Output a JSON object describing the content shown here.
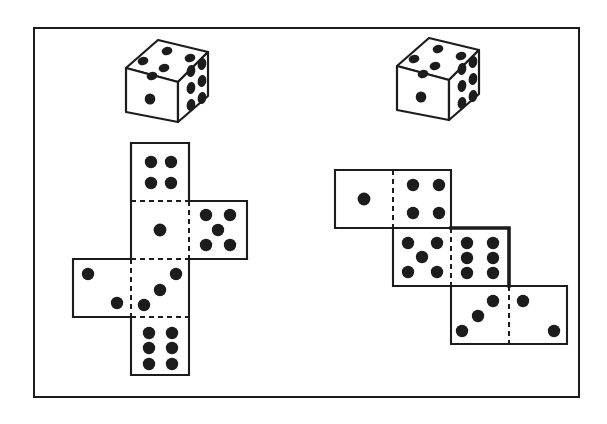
{
  "figure": {
    "background_color": "#ffffff",
    "ink_color": "#1c1c1c",
    "frame": {
      "x": 33,
      "y": 27,
      "width": 547,
      "height": 371,
      "border_width": 2
    }
  },
  "dice_3d": [
    {
      "id": "die-left",
      "label": "left isometric die",
      "x": 112,
      "y": 30,
      "faces": {
        "front": 1,
        "top": 5,
        "right": 6
      }
    },
    {
      "id": "die-right",
      "label": "right isometric die",
      "x": 383,
      "y": 28,
      "faces": {
        "front": 1,
        "top": 5,
        "right": 6
      }
    }
  ],
  "nets": [
    {
      "id": "net-cross",
      "label": "cross shaped net",
      "shape": "cross",
      "origin_x": 73,
      "origin_y": 143,
      "cell": 58,
      "panels": [
        {
          "name": "panel-top",
          "col": 1,
          "row": 0,
          "pips": 4,
          "pattern": "four",
          "bold_edges": []
        },
        {
          "name": "panel-center",
          "col": 1,
          "row": 1,
          "pips": 1,
          "pattern": "one",
          "bold_edges": []
        },
        {
          "name": "panel-right",
          "col": 2,
          "row": 1,
          "pips": 5,
          "pattern": "five",
          "bold_edges": []
        },
        {
          "name": "panel-left",
          "col": 0,
          "row": 2,
          "pips": 2,
          "pattern": "two-diagonal",
          "bold_edges": []
        },
        {
          "name": "panel-center-lower",
          "col": 1,
          "row": 2,
          "pips": 3,
          "pattern": "three-diagonal",
          "bold_edges": []
        },
        {
          "name": "panel-bottom",
          "col": 1,
          "row": 3,
          "pips": 6,
          "pattern": "six",
          "bold_edges": []
        }
      ]
    },
    {
      "id": "net-staircase",
      "label": "staircase shaped net",
      "shape": "staircase",
      "origin_x": 335,
      "origin_y": 170,
      "cell": 58,
      "panels": [
        {
          "name": "panel-top-left",
          "col": 0,
          "row": 0,
          "pips": 1,
          "pattern": "one",
          "bold_edges": []
        },
        {
          "name": "panel-top-right",
          "col": 1,
          "row": 0,
          "pips": 4,
          "pattern": "four",
          "bold_edges": []
        },
        {
          "name": "panel-mid-left",
          "col": 1,
          "row": 1,
          "pips": 5,
          "pattern": "five",
          "bold_edges": []
        },
        {
          "name": "panel-mid-right",
          "col": 2,
          "row": 1,
          "pips": 6,
          "pattern": "six",
          "bold_edges": [
            "top",
            "right"
          ]
        },
        {
          "name": "panel-bottom-left",
          "col": 2,
          "row": 2,
          "pips": 3,
          "pattern": "three-diagonal",
          "bold_edges": []
        },
        {
          "name": "panel-bottom-right",
          "col": 3,
          "row": 2,
          "pips": 2,
          "pattern": "two-diagonal",
          "bold_edges": []
        }
      ]
    }
  ]
}
